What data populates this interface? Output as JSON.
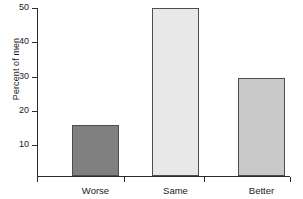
{
  "chart_data": {
    "type": "bar",
    "title": "",
    "subtitle": "",
    "xlabel": "",
    "ylabel": "Percent of men",
    "categories": [
      "Worse",
      "Same",
      "Better"
    ],
    "values": [
      15.7,
      50.0,
      29.5
    ],
    "series": [
      {
        "name": "Percent of men",
        "values": [
          15.7,
          50.0,
          29.5
        ]
      }
    ],
    "bar_colors": [
      "#808080",
      "#e8e8e8",
      "#c9c9c9"
    ],
    "bar_border_color": "#4d4d4d",
    "ylim": [
      0,
      52
    ],
    "y_ticks": [
      10,
      20,
      30,
      40,
      50
    ],
    "y_tick_labels": [
      "10",
      "20",
      "30",
      "40",
      "50"
    ],
    "x_tick_labels": [
      "Worse",
      "Same",
      "Better"
    ],
    "grid": false,
    "legend": false,
    "legend_position": "none",
    "background_color": "#ffffff",
    "axis_color": "#2b2b2b"
  },
  "axis": {
    "y_title": "Percent of men"
  },
  "ticks": {
    "y": [
      {
        "label": "50",
        "value": 50
      },
      {
        "label": "40",
        "value": 40
      },
      {
        "label": "30",
        "value": 30
      },
      {
        "label": "20",
        "value": 20
      },
      {
        "label": "10",
        "value": 10
      }
    ],
    "x": [
      {
        "label": "Worse"
      },
      {
        "label": "Same"
      },
      {
        "label": "Better"
      }
    ]
  },
  "bars": [
    {
      "label": "Worse",
      "value": 15.7,
      "color": "#808080"
    },
    {
      "label": "Same",
      "value": 50.0,
      "color": "#e8e8e8"
    },
    {
      "label": "Better",
      "value": 29.5,
      "color": "#c9c9c9"
    }
  ]
}
